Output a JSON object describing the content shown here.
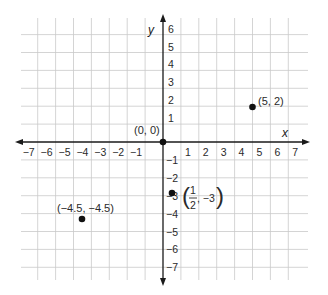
{
  "chart_data": {
    "type": "scatter",
    "title": "",
    "xlabel": "x",
    "ylabel": "y",
    "xlim": [
      -7,
      7
    ],
    "ylim": [
      -7,
      6
    ],
    "grid": true,
    "x_ticks": [
      -7,
      -6,
      -5,
      -4,
      -3,
      -2,
      -1,
      1,
      2,
      3,
      4,
      5,
      6,
      7
    ],
    "y_ticks": [
      6,
      5,
      4,
      3,
      2,
      1,
      -1,
      -2,
      -3,
      -4,
      -5,
      -6,
      -7
    ],
    "x_tick_labels": [
      "−7",
      "−6",
      "−5",
      "−4",
      "−3",
      "−2",
      "−1",
      "1",
      "2",
      "3",
      "4",
      "5",
      "6",
      "7"
    ],
    "y_tick_labels": [
      "6",
      "5",
      "4",
      "3",
      "2",
      "1",
      "−1",
      "−2",
      "−3",
      "−4",
      "−5",
      "−6",
      "−7"
    ],
    "points": [
      {
        "x": 0,
        "y": 0,
        "label": "(0, 0)"
      },
      {
        "x": 5,
        "y": 2,
        "label": "(5, 2)"
      },
      {
        "x": -4.5,
        "y": -4.5,
        "label": "(−4.5, −4.5)"
      },
      {
        "x": 0.5,
        "y": -3,
        "label": "(1/2, −3)"
      }
    ]
  },
  "labels": {
    "x_axis": "x",
    "y_axis": "y",
    "origin": "(0, 0)",
    "p1": "(5, 2)",
    "p2": "(−4.5, −4.5)",
    "p3_open": "(",
    "p3_num": "1",
    "p3_den": "2",
    "p3_rest": ", −3",
    "p3_close": ")"
  },
  "colors": {
    "grid": "#c9c9c9",
    "axis": "#1a1a1a",
    "point": "#111111"
  }
}
